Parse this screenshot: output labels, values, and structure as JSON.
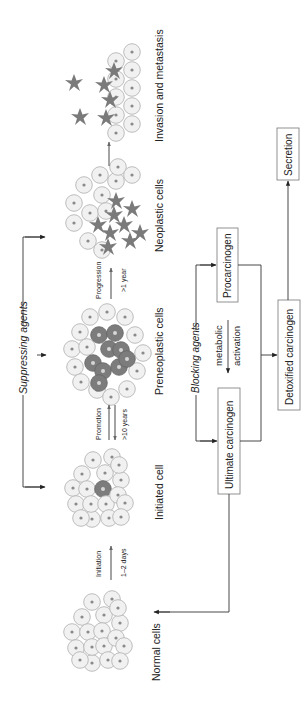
{
  "diagram": {
    "orientation": "rotated -90deg (reads bottom-to-top)",
    "stages": [
      {
        "id": "normal",
        "label": "Normal cells"
      },
      {
        "id": "initiated",
        "label": "Initiated cell"
      },
      {
        "id": "preneoplastic",
        "label": "Preneoplastic cells"
      },
      {
        "id": "neoplastic",
        "label": "Neoplastic cells"
      },
      {
        "id": "invasion",
        "label": "Invasion and metastasis"
      }
    ],
    "transitions": [
      {
        "label": "Initiation",
        "duration": "1–2 days"
      },
      {
        "label": "Promotion",
        "duration": ">10 years"
      },
      {
        "label": "Progression",
        "duration": ">1 year"
      }
    ],
    "suppressing_agents": "Suppressing agents",
    "blocking_agents": "Blocking agents",
    "metabolism": {
      "procarcinogen": "Procarcinogen",
      "ultimate_carcinogen": "Ultimate carcinogen",
      "activation_line1": "metabolic",
      "activation_line2": "activation",
      "detoxified": "Detoxified carcinogen",
      "secretion": "Secretion"
    },
    "colors": {
      "normal_cell": "#f1f1f1",
      "cell_outline": "#b5b5b5",
      "altered_cell": "#7c7c7c",
      "line": "#333333"
    }
  }
}
